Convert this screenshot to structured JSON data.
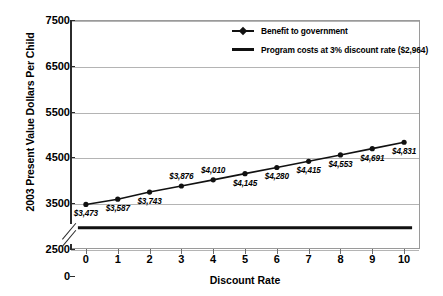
{
  "chart_data": {
    "type": "line",
    "title": "",
    "xlabel": "Discount Rate",
    "ylabel": "2003 Present Value Dollars Per Child",
    "x": [
      0,
      1,
      2,
      3,
      4,
      5,
      6,
      7,
      8,
      9,
      10
    ],
    "xticklabels": [
      "0",
      "1",
      "2",
      "3",
      "4",
      "5",
      "6",
      "7",
      "8",
      "9",
      "10"
    ],
    "yticks": [
      0,
      2500,
      3500,
      4500,
      5500,
      6500,
      7500
    ],
    "yticklabels": [
      "0",
      "2500",
      "3500",
      "4500",
      "5500",
      "6500",
      "7500"
    ],
    "ylim": [
      2500,
      7500
    ],
    "xlim": [
      -0.5,
      10.5
    ],
    "axis_break": true,
    "axis_break_note": "y-axis broken between 0 and 2500",
    "grid": "horizontal",
    "legend_position": "top-right-inside",
    "series": [
      {
        "name": "Benefit to government",
        "type": "line-marker",
        "color": "#111111",
        "values": [
          3473,
          3587,
          3743,
          3876,
          4010,
          4145,
          4280,
          4415,
          4553,
          4691,
          4831
        ],
        "data_labels": [
          "$3,473",
          "$3,587",
          "$3,743",
          "$3,876",
          "$4,010",
          "$4,145",
          "$4,280",
          "$4,415",
          "$4,553",
          "$4,691",
          "$4,831"
        ],
        "label_positions": [
          "below",
          "below",
          "below",
          "above",
          "above",
          "below",
          "below",
          "below",
          "below",
          "below",
          "below"
        ]
      },
      {
        "name": "Program costs at 3% discount rate ($2,964)",
        "type": "constant-line",
        "color": "#111111",
        "constant_value": 2964,
        "values": [
          2964,
          2964,
          2964,
          2964,
          2964,
          2964,
          2964,
          2964,
          2964,
          2964,
          2964
        ]
      }
    ]
  },
  "legend": {
    "items": [
      {
        "label": "Benefit to government",
        "marker": "line-with-diamond-marker"
      },
      {
        "label": "Program costs at 3% discount rate ($2,964)",
        "marker": "thick-line"
      }
    ]
  },
  "axes": {
    "x_title": "Discount Rate",
    "y_title": "2003 Present Value Dollars Per Child"
  },
  "colors": {
    "series": "#111111",
    "gridline": "#b4b4b4",
    "axis": "#2b2b2b",
    "background": "#ffffff"
  }
}
